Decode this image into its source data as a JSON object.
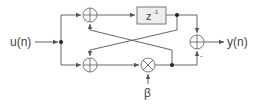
{
  "diagram": {
    "input_label": "u(n)",
    "output_label": "y(n)",
    "delay_label": "z",
    "delay_exponent": "-1",
    "gain_label": "β",
    "minus_sign": "-",
    "line_color": "#555555"
  }
}
